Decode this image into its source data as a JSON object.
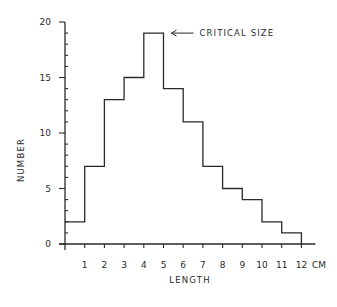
{
  "chart_data": {
    "type": "bar",
    "subtype": "histogram",
    "title": "",
    "xlabel": "LENGTH",
    "ylabel": "NUMBER",
    "x_unit": "CM",
    "bin_edges": [
      0,
      1,
      2,
      3,
      4,
      5,
      6,
      7,
      8,
      9,
      10,
      11,
      12
    ],
    "categories": [
      "0-1",
      "1-2",
      "2-3",
      "3-4",
      "4-5",
      "5-6",
      "6-7",
      "7-8",
      "8-9",
      "9-10",
      "10-11",
      "11-12"
    ],
    "values": [
      2,
      7,
      13,
      15,
      19,
      14,
      11,
      7,
      5,
      4,
      2,
      1
    ],
    "xlim": [
      0,
      12
    ],
    "ylim": [
      0,
      20
    ],
    "x_ticks": [
      "1",
      "2",
      "3",
      "4",
      "5",
      "6",
      "7",
      "8",
      "9",
      "10",
      "11",
      "12"
    ],
    "y_ticks": [
      "0",
      "5",
      "10",
      "15",
      "20"
    ],
    "y_minor_tick_step": 1,
    "grid": false,
    "legend": null,
    "annotations": [
      {
        "text": "CRITICAL SIZE",
        "arrow": "left",
        "points_to_bin": "4-5",
        "value": 19
      }
    ],
    "colors": {
      "line": "#2a2a2a",
      "background": "#ffffff"
    }
  }
}
